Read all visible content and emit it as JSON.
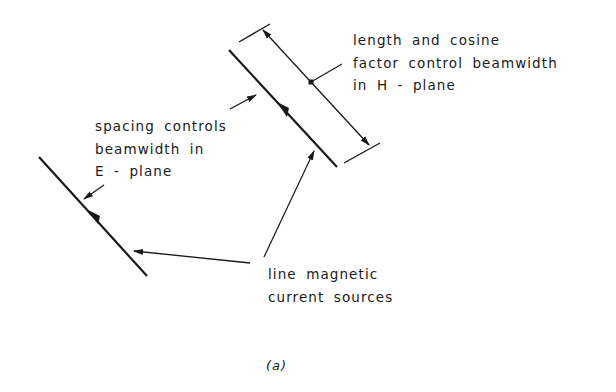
{
  "diagram": {
    "type": "antenna-line-source-schematic",
    "colors": {
      "ink": "#1a1a1a",
      "background": "#ffffff"
    },
    "labels": {
      "h_plane": {
        "lines": [
          "length and cosine",
          "factor control beamwidth",
          "in H - plane"
        ]
      },
      "e_plane": {
        "lines": [
          "spacing controls",
          "beamwidth in",
          "E - plane"
        ]
      },
      "sources": {
        "lines": [
          "line magnetic",
          "current sources"
        ]
      }
    },
    "caption": "(a)",
    "elements": {
      "left_source_line": {
        "x1": 39,
        "y1": 157,
        "x2": 147,
        "y2": 276,
        "arrow": "current-direction-up"
      },
      "right_source_line": {
        "x1": 229,
        "y1": 50,
        "x2": 337,
        "y2": 167,
        "arrow": "current-direction-up"
      },
      "dimension_line": {
        "x1": 262,
        "y1": 29,
        "x2": 370,
        "y2": 146,
        "marker": "double-arrow",
        "midpoint_dot": [
          311,
          82
        ]
      },
      "extension_lines": [
        {
          "x1": 239,
          "y1": 42,
          "x2": 270,
          "y2": 24
        },
        {
          "x1": 344,
          "y1": 163,
          "x2": 380,
          "y2": 143
        }
      ],
      "spacing_arrows": [
        {
          "from": [
            104,
            185
          ],
          "to": [
            83,
            200
          ]
        },
        {
          "from": [
            230,
            109
          ],
          "to": [
            257,
            95
          ]
        }
      ],
      "source_leaders": [
        {
          "from": [
            250,
            263
          ],
          "to": [
            133,
            251
          ]
        },
        {
          "from": [
            264,
            257
          ],
          "to": [
            315,
            150
          ]
        }
      ],
      "h_plane_leader": {
        "from": [
          311,
          82
        ],
        "to": [
          342,
          64
        ]
      }
    }
  }
}
